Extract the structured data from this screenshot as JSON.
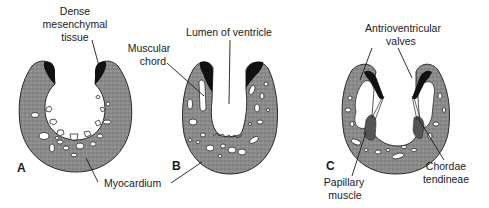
{
  "figure": {
    "colors": {
      "background": "#ffffff",
      "myocardium": "#8a8a8a",
      "dense_tissue": "#111111",
      "papillary": "#555555",
      "text": "#1a1a1a"
    },
    "panels": [
      {
        "letter": "A",
        "labels": {
          "dense_line1": "Dense",
          "dense_line2": "mesenchymal",
          "dense_line3": "tissue"
        }
      },
      {
        "letter": "B",
        "labels": {
          "lumen": "Lumen of ventricle",
          "muscular_line1": "Muscular",
          "muscular_line2": "chord"
        }
      },
      {
        "letter": "C",
        "labels": {
          "av_line1": "Antrioventricular",
          "av_line2": "valves",
          "papillary_line1": "Papillary",
          "papillary_line2": "muscle",
          "chordae_line1": "Chordae",
          "chordae_line2": "tendineae"
        }
      }
    ],
    "shared_labels": {
      "myocardium": "Myocardium"
    }
  }
}
